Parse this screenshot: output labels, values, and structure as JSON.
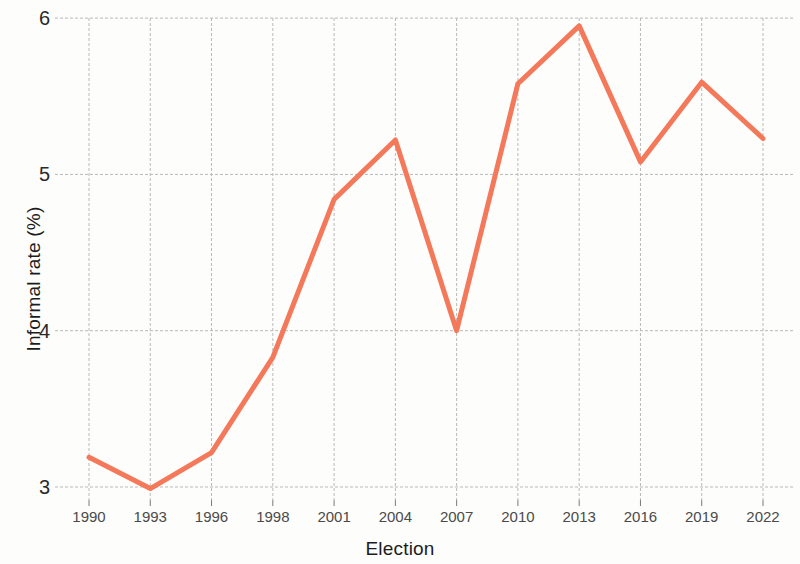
{
  "chart_data": {
    "type": "line",
    "title": "",
    "xlabel": "Election",
    "ylabel": "Informal rate (%)",
    "categories": [
      "1990",
      "1993",
      "1996",
      "1998",
      "2001",
      "2004",
      "2007",
      "2010",
      "2013",
      "2016",
      "2019",
      "2022"
    ],
    "values": [
      3.19,
      2.99,
      3.22,
      3.83,
      4.84,
      5.22,
      4.0,
      5.58,
      5.95,
      5.08,
      5.59,
      5.23
    ],
    "series": [
      {
        "name": "Informal rate",
        "color": "#f4795a",
        "values": [
          3.19,
          2.99,
          3.22,
          3.83,
          4.84,
          5.22,
          4.0,
          5.58,
          5.95,
          5.08,
          5.59,
          5.23
        ]
      }
    ],
    "x_tick_labels": [
      "1990",
      "1993",
      "1996",
      "1998",
      "2001",
      "2004",
      "2007",
      "2010",
      "2013",
      "2016",
      "2019",
      "2022"
    ],
    "y_tick_labels": [
      "3",
      "4",
      "5",
      "6"
    ],
    "y_ticks": [
      3,
      4,
      5,
      6
    ],
    "ylim": [
      2.88,
      6.02
    ],
    "xlim": [
      0,
      11
    ],
    "grid": true,
    "grid_color": "#b9b9b9",
    "legend": "none",
    "line_width": 5,
    "background": "#fdfdfc"
  },
  "axes": {
    "x_title": "Election",
    "y_title": "Informal rate (%)"
  }
}
